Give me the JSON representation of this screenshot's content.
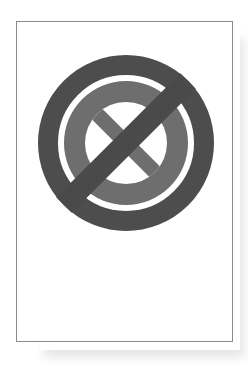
{
  "card": {
    "label": ""
  },
  "icon": {
    "name": "prohibited-cancel-icon",
    "description": "No-cancel sign: circled X crossed by a diagonal slash",
    "colors": {
      "outer_ring": "#4d4d4d",
      "slash": "#4a4a4a",
      "inner_ring": "#6e6e6e",
      "inner_x": "#6e6e6e",
      "background": "#ffffff",
      "card_border": "#8a8a8a"
    }
  }
}
